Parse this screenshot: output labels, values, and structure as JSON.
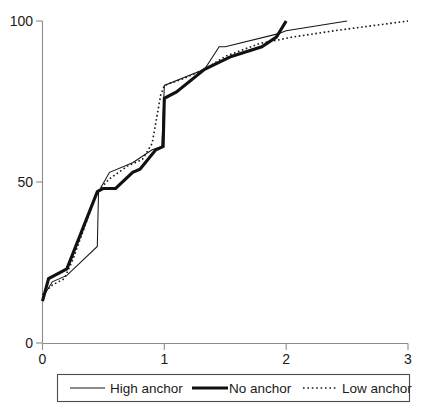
{
  "chart_data": {
    "type": "line",
    "title": "",
    "subtitle": "",
    "xlabel": "",
    "ylabel": "",
    "xlim": [
      0,
      3
    ],
    "ylim": [
      0,
      100
    ],
    "xticks": [
      "0",
      "1",
      "2",
      "3"
    ],
    "xtick_values": [
      0,
      1,
      2,
      3
    ],
    "yticks": [
      "0",
      "50",
      "100"
    ],
    "ytick_values": [
      0,
      50,
      100
    ],
    "grid": false,
    "legend_position": "bottom",
    "series": [
      {
        "name": "High anchor",
        "style": "thin-solid",
        "color": "#171717",
        "points": [
          [
            0.0,
            14
          ],
          [
            0.08,
            19
          ],
          [
            0.2,
            21
          ],
          [
            0.45,
            30
          ],
          [
            0.46,
            47
          ],
          [
            0.55,
            53
          ],
          [
            0.74,
            56
          ],
          [
            0.78,
            57
          ],
          [
            0.9,
            60
          ],
          [
            0.98,
            61
          ],
          [
            1.0,
            80
          ],
          [
            1.33,
            85
          ],
          [
            1.45,
            92
          ],
          [
            1.5,
            92
          ],
          [
            1.93,
            96
          ],
          [
            2.0,
            97
          ],
          [
            2.5,
            100
          ]
        ]
      },
      {
        "name": "No anchor",
        "style": "thick-solid",
        "color": "#111111",
        "points": [
          [
            0.0,
            13
          ],
          [
            0.05,
            20
          ],
          [
            0.2,
            23
          ],
          [
            0.45,
            47
          ],
          [
            0.5,
            48
          ],
          [
            0.6,
            48
          ],
          [
            0.74,
            53
          ],
          [
            0.8,
            54
          ],
          [
            0.93,
            60
          ],
          [
            0.99,
            61
          ],
          [
            1.0,
            76
          ],
          [
            1.1,
            78
          ],
          [
            1.33,
            85
          ],
          [
            1.55,
            89
          ],
          [
            1.8,
            92
          ],
          [
            1.92,
            95
          ],
          [
            2.0,
            100
          ]
        ]
      },
      {
        "name": "Low anchor",
        "style": "dotted",
        "color": "#171717",
        "points": [
          [
            0.0,
            15
          ],
          [
            0.08,
            18
          ],
          [
            0.18,
            20
          ],
          [
            0.25,
            26
          ],
          [
            0.45,
            47
          ],
          [
            0.55,
            51
          ],
          [
            0.7,
            55
          ],
          [
            0.82,
            57
          ],
          [
            0.9,
            62
          ],
          [
            0.97,
            77
          ],
          [
            1.0,
            80
          ],
          [
            1.15,
            82
          ],
          [
            1.33,
            85
          ],
          [
            1.5,
            89
          ],
          [
            1.78,
            93
          ],
          [
            1.92,
            94
          ],
          [
            2.05,
            95
          ],
          [
            2.4,
            97
          ],
          [
            3.0,
            100
          ]
        ]
      }
    ]
  },
  "legend": {
    "items": [
      {
        "label": "High anchor",
        "swatch": "thin-solid-swatch"
      },
      {
        "label": "No anchor",
        "swatch": "thick-solid-swatch"
      },
      {
        "label": "Low anchor",
        "swatch": "dotted-swatch"
      }
    ]
  },
  "axes": {
    "y_tick_100": "100",
    "y_tick_50": "50",
    "y_tick_0": "0",
    "x_tick_0": "0",
    "x_tick_1": "1",
    "x_tick_2": "2",
    "x_tick_3": "3"
  }
}
